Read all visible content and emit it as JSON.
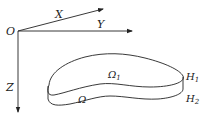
{
  "diagram": {
    "type": "coordinate-system-with-domain",
    "axes": {
      "origin_label": "O",
      "x_label": "X",
      "y_label": "Y",
      "z_label": "Z"
    },
    "domain": {
      "top_surface_label": "Ω",
      "top_surface_subscript": "1",
      "side_label": "Ω",
      "upper_height_label": "H",
      "upper_height_subscript": "1",
      "lower_height_label": "H",
      "lower_height_subscript": "2"
    },
    "colors": {
      "stroke": "#222222",
      "background": "#ffffff"
    }
  }
}
